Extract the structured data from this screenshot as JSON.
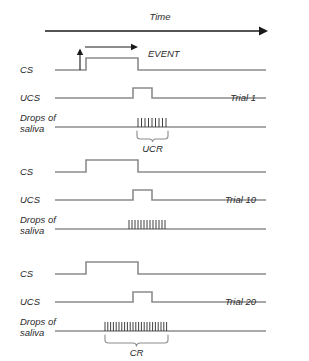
{
  "figure": {
    "title_axis": "Time",
    "event_label": "EVENT",
    "colors": {
      "trace": "#8c8c8c",
      "axis": "#1a1a1a",
      "text": "#2b2b2b",
      "background": "#ffffff"
    }
  },
  "row_labels": {
    "cs": "CS",
    "ucs": "UCS",
    "drops_line1": "Drops of",
    "drops_line2": "saliva"
  },
  "blocks": [
    {
      "trial_label": "Trial 1",
      "cs": {
        "onset": 86,
        "offset": 138,
        "high": true
      },
      "ucs": {
        "onset": 133,
        "offset": 152,
        "high": true
      },
      "saliva": {
        "tick_start": 138,
        "tick_end": 166,
        "tick_count": 9
      },
      "response": {
        "label": "UCR",
        "brace_start": 137,
        "brace_end": 168
      }
    },
    {
      "trial_label": "Trial 10",
      "cs": {
        "onset": 86,
        "offset": 138,
        "high": true
      },
      "ucs": {
        "onset": 133,
        "offset": 152,
        "high": true
      },
      "saliva": {
        "tick_start": 129,
        "tick_end": 166,
        "tick_count": 13
      },
      "response": {
        "label": "",
        "brace_start": 0,
        "brace_end": 0
      }
    },
    {
      "trial_label": "Trial 20",
      "cs": {
        "onset": 86,
        "offset": 138,
        "high": true
      },
      "ucs": {
        "onset": 133,
        "offset": 152,
        "high": true
      },
      "saliva": {
        "tick_start": 105,
        "tick_end": 167,
        "tick_count": 23
      },
      "response": {
        "label": "CR",
        "brace_start": 105,
        "brace_end": 168
      }
    }
  ],
  "axis": {
    "line_start_x": 45,
    "line_end_x": 266,
    "line_y": 31
  }
}
